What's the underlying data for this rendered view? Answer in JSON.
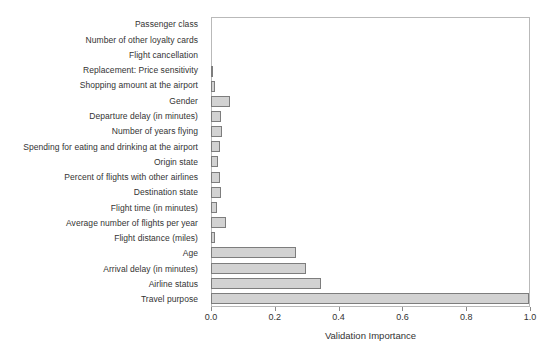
{
  "chart_data": {
    "type": "bar",
    "orientation": "horizontal",
    "title": "",
    "xlabel": "Validation Importance",
    "ylabel": "",
    "xlim": [
      0.0,
      1.0
    ],
    "xticks": [
      "0.0",
      "0.2",
      "0.4",
      "0.6",
      "0.8",
      "1.0"
    ],
    "xtick_values": [
      0.0,
      0.2,
      0.4,
      0.6,
      0.8,
      1.0
    ],
    "grid": false,
    "legend": null,
    "bar_color": "#d2d2d2",
    "bar_edge_color": "#7d7d7d",
    "categories": [
      "Passenger class",
      "Number of other loyalty cards",
      "Flight cancellation",
      "Replacement: Price sensitivity",
      "Shopping amount at the airport",
      "Gender",
      "Departure delay (in minutes)",
      "Number of years flying",
      "Spending for eating and drinking at the airport",
      "Origin state",
      "Percent of flights with other airlines",
      "Destination state",
      "Flight time (in minutes)",
      "Average number of flights per year",
      "Flight distance (miles)",
      "Age",
      "Arrival delay (in minutes)",
      "Airline status",
      "Travel purpose"
    ],
    "values": [
      0.0,
      0.0,
      0.0,
      0.007,
      0.012,
      0.059,
      0.032,
      0.035,
      0.029,
      0.022,
      0.028,
      0.031,
      0.019,
      0.047,
      0.012,
      0.267,
      0.299,
      0.346,
      1.0
    ]
  }
}
